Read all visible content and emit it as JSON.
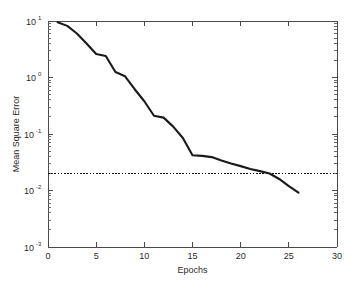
{
  "chart_data": {
    "type": "line",
    "title": "",
    "xlabel": "Epochs",
    "ylabel": "Mean Square Error",
    "xlim": [
      0,
      30
    ],
    "ylim": [
      0.001,
      10
    ],
    "yscale": "log",
    "xscale": "linear",
    "grid": false,
    "legend": null,
    "xticks": [
      0,
      5,
      10,
      15,
      20,
      25,
      30
    ],
    "xticklabels": [
      "0",
      "5",
      "10",
      "15",
      "20",
      "25",
      "30"
    ],
    "yticks": [
      10,
      1,
      0.1,
      0.01,
      0.001
    ],
    "yticklabels": [
      "10^1",
      "10^0",
      "10^-1",
      "10^-2",
      "10^-3"
    ],
    "ytick_bases": [
      "10",
      "10",
      "10",
      "10",
      "10"
    ],
    "ytick_exponents": [
      "1",
      "0",
      "-1",
      "-2",
      "-3"
    ],
    "series": [
      {
        "name": "Training error",
        "style": "solid",
        "color": "#1a1a1a",
        "x": [
          1,
          2,
          3,
          4,
          5,
          6,
          7,
          8,
          9,
          10,
          11,
          12,
          13,
          14,
          15,
          16,
          17,
          18,
          19,
          20,
          21,
          22,
          23,
          24,
          25,
          26
        ],
        "y": [
          9.5,
          8.2,
          6.0,
          4.0,
          2.6,
          2.4,
          1.25,
          1.05,
          0.62,
          0.38,
          0.21,
          0.195,
          0.135,
          0.085,
          0.042,
          0.041,
          0.039,
          0.034,
          0.03,
          0.027,
          0.024,
          0.022,
          0.02,
          0.016,
          0.012,
          0.0092
        ]
      },
      {
        "name": "Goal",
        "style": "dotted",
        "color": "#111111",
        "constant_y": 0.02,
        "x": [
          0,
          30
        ]
      }
    ]
  },
  "figure": {
    "background_color": "#ffffff",
    "axes_color": "#4a4a4a",
    "text_color": "#2b2b2b"
  }
}
